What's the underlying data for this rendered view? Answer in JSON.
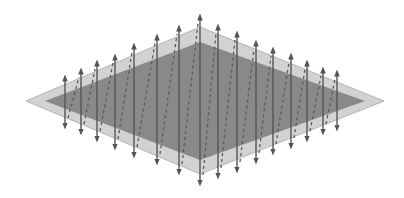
{
  "diagram": {
    "type": "isometric-plane-with-vertical-arrows",
    "colors": {
      "background": "#ffffff",
      "outer_plane": "#d2d2d2",
      "outer_edge": "#b4b4b4",
      "inner_plane": "#898989",
      "arrow": "#555555",
      "dashed": "#5a5a5a"
    },
    "outer_rhombus": {
      "left": [
        26,
        101
      ],
      "top": [
        200,
        27
      ],
      "right": [
        384,
        101
      ],
      "bottom": [
        200,
        174
      ]
    },
    "inner_rhombus": {
      "left": [
        45,
        101
      ],
      "top": [
        200,
        42
      ],
      "right": [
        365,
        101
      ],
      "bottom": [
        200,
        160
      ]
    },
    "arrows": [
      {
        "x": 65,
        "top": 78,
        "bottom": 126
      },
      {
        "x": 81,
        "top": 71,
        "bottom": 132
      },
      {
        "x": 97,
        "top": 63,
        "bottom": 139
      },
      {
        "x": 115,
        "top": 57,
        "bottom": 147
      },
      {
        "x": 134,
        "top": 46,
        "bottom": 155
      },
      {
        "x": 157,
        "top": 37,
        "bottom": 162
      },
      {
        "x": 179,
        "top": 28,
        "bottom": 172
      },
      {
        "x": 200,
        "top": 17,
        "bottom": 183
      },
      {
        "x": 218,
        "top": 27,
        "bottom": 176
      },
      {
        "x": 237,
        "top": 34,
        "bottom": 170
      },
      {
        "x": 256,
        "top": 43,
        "bottom": 161
      },
      {
        "x": 273,
        "top": 50,
        "bottom": 152
      },
      {
        "x": 291,
        "top": 56,
        "bottom": 146
      },
      {
        "x": 307,
        "top": 63,
        "bottom": 139
      },
      {
        "x": 323,
        "top": 70,
        "bottom": 132
      },
      {
        "x": 337,
        "top": 73,
        "bottom": 128
      }
    ]
  }
}
